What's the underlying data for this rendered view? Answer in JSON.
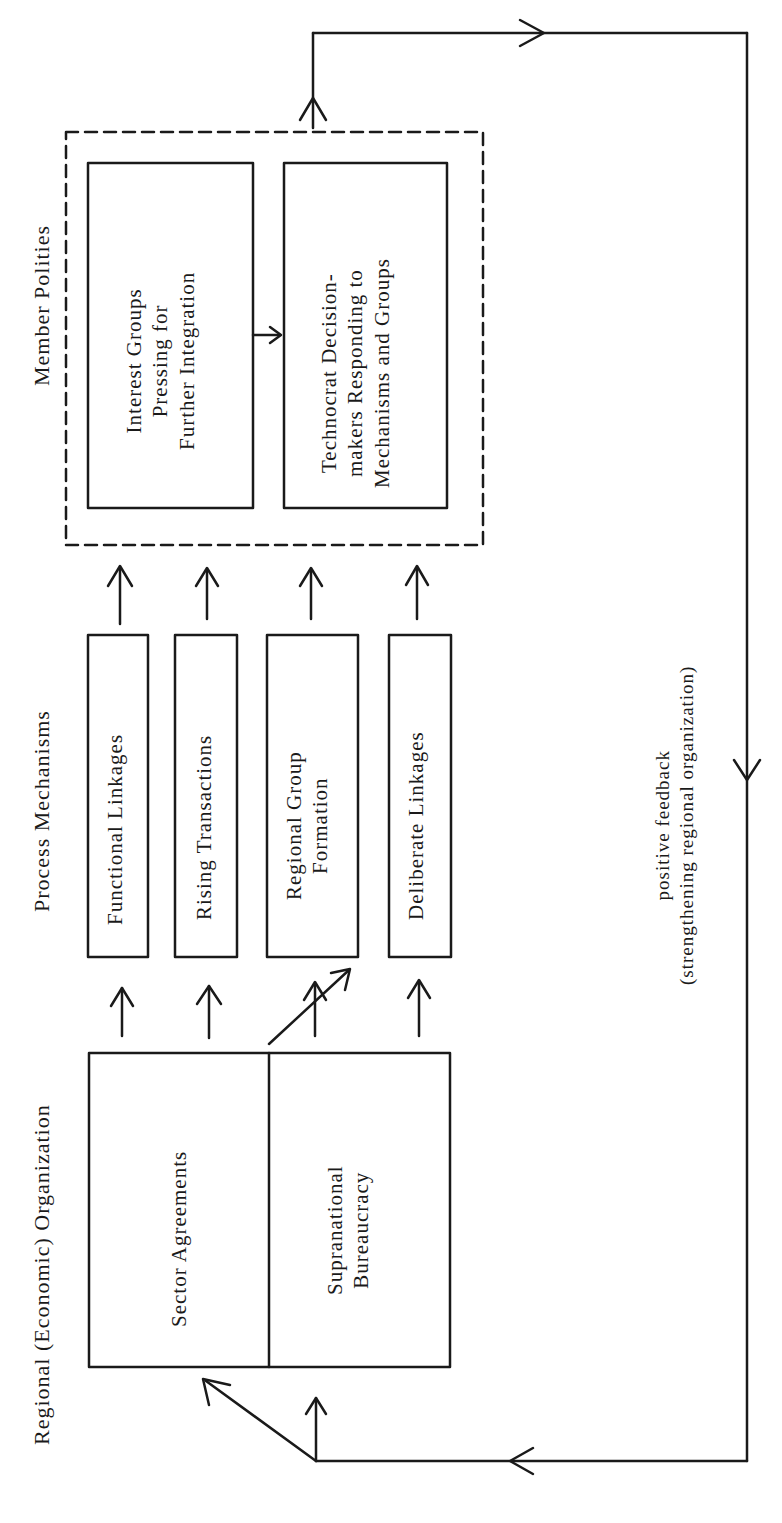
{
  "headings": {
    "regional_org": "Regional (Economic) Organization",
    "process_mechanisms": "Process Mechanisms",
    "member_polities": "Member Polities"
  },
  "regional_org_boxes": {
    "sector_agreements": "Sector Agreements",
    "supranational_bureaucracy": [
      "Supranational",
      "Bureaucracy"
    ]
  },
  "process_boxes": [
    {
      "lines": [
        "Functional Linkages"
      ]
    },
    {
      "lines": [
        "Rising Transactions"
      ]
    },
    {
      "lines": [
        "Regional Group",
        "Formation"
      ]
    },
    {
      "lines": [
        "Deliberate Linkages"
      ]
    }
  ],
  "member_polity_boxes": {
    "interest_groups": [
      "Interest Groups",
      "Pressing for",
      "Further Integration"
    ],
    "technocrats": [
      "Technocrat Decision-",
      "makers Responding to",
      "Mechanisms and Groups"
    ]
  },
  "feedback_label": [
    "positive feedback",
    "(strengthening regional organization)"
  ],
  "colors": {
    "ink": "#1a1a1a",
    "background": "#ffffff"
  }
}
